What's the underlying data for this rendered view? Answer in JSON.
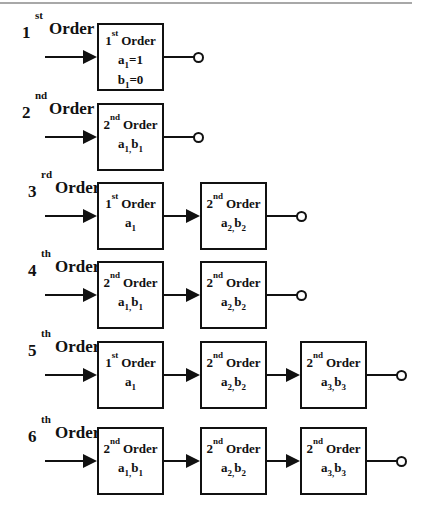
{
  "diagram": {
    "type": "cascade filter order decomposition",
    "rows": [
      {
        "order_label": {
          "num": "1",
          "sup": "st",
          "word": "Order"
        },
        "blocks": [
          {
            "num": "1",
            "sup": "st",
            "word": "Order",
            "params": [
              "a",
              "1",
              "=1"
            ],
            "params2": [
              "b",
              "1",
              "=0"
            ]
          }
        ]
      },
      {
        "order_label": {
          "num": "2",
          "sup": "nd",
          "word": "Order"
        },
        "blocks": [
          {
            "num": "2",
            "sup": "nd",
            "word": "Order",
            "coef": "a1, b1"
          }
        ]
      },
      {
        "order_label": {
          "num": "3",
          "sup": "rd",
          "word": "Order"
        },
        "blocks": [
          {
            "num": "1",
            "sup": "st",
            "word": "Order",
            "coef": "a1"
          },
          {
            "num": "2",
            "sup": "nd",
            "word": "Order",
            "coef": "a2, b2"
          }
        ]
      },
      {
        "order_label": {
          "num": "4",
          "sup": "th",
          "word": "Order"
        },
        "blocks": [
          {
            "num": "2",
            "sup": "nd",
            "word": "Order",
            "coef": "a1, b1"
          },
          {
            "num": "2",
            "sup": "nd",
            "word": "Order",
            "coef": "a2, b2"
          }
        ]
      },
      {
        "order_label": {
          "num": "5",
          "sup": "th",
          "word": "Order"
        },
        "blocks": [
          {
            "num": "1",
            "sup": "st",
            "word": "Order",
            "coef": "a1"
          },
          {
            "num": "2",
            "sup": "nd",
            "word": "Order",
            "coef": "a2, b2"
          },
          {
            "num": "2",
            "sup": "nd",
            "word": "Order",
            "coef": "a3, b3"
          }
        ]
      },
      {
        "order_label": {
          "num": "6",
          "sup": "th",
          "word": "Order"
        },
        "blocks": [
          {
            "num": "2",
            "sup": "nd",
            "word": "Order",
            "coef": "a1, b1"
          },
          {
            "num": "2",
            "sup": "nd",
            "word": "Order",
            "coef": "a2, b2"
          },
          {
            "num": "2",
            "sup": "nd",
            "word": "Order",
            "coef": "a3, b3"
          }
        ]
      }
    ],
    "subscript_parts": {
      "a": "a",
      "b": "b",
      "one": "1",
      "two": "2",
      "three": "3",
      "comma": ",",
      "eq1": "=1",
      "eq0": "=0"
    }
  }
}
